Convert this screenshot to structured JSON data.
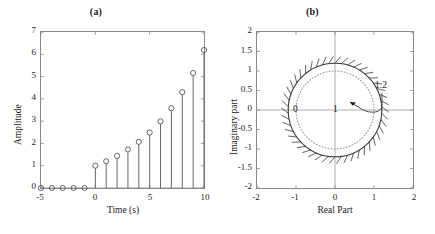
{
  "figure": {
    "panel_a": {
      "title": "(a)",
      "xlabel": "Time (s)",
      "ylabel": "Amplitude"
    },
    "panel_b": {
      "title": "(b)",
      "xlabel": "Real Part",
      "ylabel": "Imaginary part",
      "annotations": {
        "origin": "0",
        "unit": "1",
        "radius": "1.2"
      }
    }
  },
  "chart_data": [
    {
      "type": "scatter",
      "subtype": "stem",
      "title": "(a)",
      "xlabel": "Time (s)",
      "ylabel": "Amplitude",
      "xlim": [
        -5,
        10
      ],
      "ylim": [
        0,
        7
      ],
      "xticks": [
        -5,
        0,
        5,
        10
      ],
      "yticks": [
        0,
        1,
        2,
        3,
        4,
        5,
        6,
        7
      ],
      "xtick_labels": [
        "-5",
        "0",
        "5",
        "10"
      ],
      "ytick_labels": [
        "0",
        "1",
        "2",
        "3",
        "4",
        "5",
        "6",
        "7"
      ],
      "grid": false,
      "legend": false,
      "marker": "open-circle",
      "x": [
        -5,
        -4,
        -3,
        -2,
        -1,
        0,
        1,
        2,
        3,
        4,
        5,
        6,
        7,
        8,
        9,
        10
      ],
      "values": [
        0,
        0,
        0,
        0,
        0,
        1,
        1.2,
        1.44,
        1.73,
        2.07,
        2.49,
        2.99,
        3.58,
        4.3,
        5.16,
        6.19
      ],
      "note": "Causal exponential sequence 1.2^n u[n]"
    },
    {
      "type": "scatter",
      "subtype": "roc-pole-zero",
      "title": "(b)",
      "xlabel": "Real Part",
      "ylabel": "Imaginary part",
      "xlim": [
        -2,
        2
      ],
      "ylim": [
        -2,
        2
      ],
      "xticks": [
        -2,
        -1,
        0,
        1,
        2
      ],
      "yticks": [
        -2,
        -1.5,
        -1,
        -0.5,
        0,
        0.5,
        1,
        1.5,
        2
      ],
      "xtick_labels": [
        "-2",
        "-1",
        "0",
        "1",
        "2"
      ],
      "ytick_labels": [
        "-2",
        "-1.5",
        "-1",
        "-0.5",
        "0",
        "0.5",
        "1",
        "1.5",
        "2"
      ],
      "grid": false,
      "legend": false,
      "circles": [
        {
          "name": "roc-boundary",
          "radius": 1.2,
          "style": "solid",
          "hatched": true,
          "hatch_side": "outside"
        },
        {
          "name": "unit-circle",
          "radius": 1.0,
          "style": "dotted"
        }
      ],
      "labels": [
        {
          "text": "0",
          "x": 0,
          "y": 0
        },
        {
          "text": "1",
          "x": 1,
          "y": 0
        },
        {
          "text": "1.2",
          "x": 1.55,
          "y": 0.52
        }
      ],
      "pointer": {
        "text": "1.2",
        "target_x": 1.2,
        "target_y": 0
      }
    }
  ],
  "style": {
    "axis_color": "#8a8a8a",
    "line_color": "#3a3a3a",
    "text_color": "#1a1a1a",
    "background": "#ffffff"
  }
}
